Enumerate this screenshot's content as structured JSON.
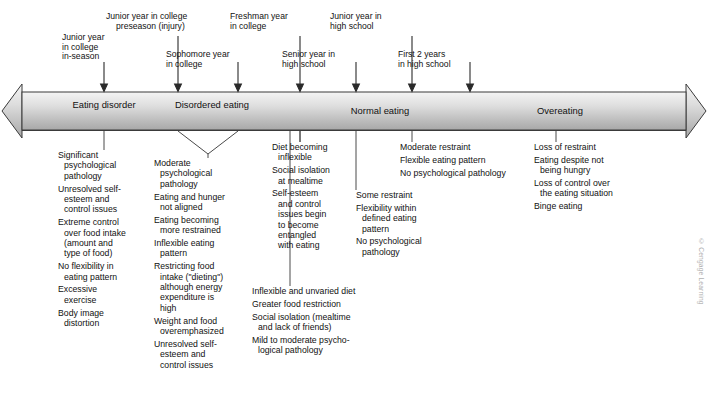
{
  "figure": {
    "credit": "© Cengage Learning",
    "caption": ""
  },
  "band": {
    "stages": [
      {
        "label_line1": "Eating",
        "label_line2": "disorder"
      },
      {
        "label_line1": "Disordered",
        "label_line2": "eating"
      },
      {
        "label_line1": "Normal eating",
        "label_line2": ""
      },
      {
        "label_line1": "Overeating",
        "label_line2": ""
      }
    ]
  },
  "callouts": [
    {
      "lines": [
        "Junior year",
        "in college",
        "in-season"
      ]
    },
    {
      "lines": [
        "Junior year in college",
        "preseason (injury)"
      ]
    },
    {
      "lines": [
        "Sophomore year",
        "in college"
      ]
    },
    {
      "lines": [
        "Freshman year",
        "in college"
      ]
    },
    {
      "lines": [
        "Senior year in",
        "high school"
      ]
    },
    {
      "lines": [
        "Junior year in",
        "high school"
      ]
    },
    {
      "lines": [
        "First 2 years",
        "in high school"
      ]
    }
  ],
  "columns": [
    {
      "name": "eating-disorder-traits",
      "items": [
        {
          "lines": [
            "Significant",
            "psychological",
            "pathology"
          ]
        },
        {
          "lines": [
            "Unresolved self-",
            "esteem and",
            "control issues"
          ]
        },
        {
          "lines": [
            "Extreme control",
            "over food intake",
            "(amount and",
            "type of food)"
          ]
        },
        {
          "lines": [
            "No flexibility in",
            "eating pattern"
          ]
        },
        {
          "lines": [
            "Excessive",
            "exercise"
          ]
        },
        {
          "lines": [
            "Body image",
            "distortion"
          ]
        }
      ]
    },
    {
      "name": "disordered-eating-traits",
      "items": [
        {
          "lines": [
            "Moderate",
            "psychological",
            "pathology"
          ]
        },
        {
          "lines": [
            "Eating and hunger",
            "not aligned"
          ]
        },
        {
          "lines": [
            "Eating becoming",
            "more restrained"
          ]
        },
        {
          "lines": [
            "Inflexible eating",
            "pattern"
          ]
        },
        {
          "lines": [
            "Restricting food",
            "intake (\"dieting\")",
            "although energy",
            "expenditure is",
            "high"
          ]
        },
        {
          "lines": [
            "Weight and food",
            "overemphasized"
          ]
        },
        {
          "lines": [
            "Unresolved self-",
            "esteem and",
            "control issues"
          ]
        }
      ]
    },
    {
      "name": "diet-becoming-inflexible-traits",
      "items": [
        {
          "lines": [
            "Diet becoming",
            "inflexible"
          ]
        },
        {
          "lines": [
            "Social isolation",
            "at mealtime"
          ]
        },
        {
          "lines": [
            "Self-esteem",
            "and control",
            "issues begin",
            "to become",
            "entangled",
            "with eating"
          ]
        }
      ]
    },
    {
      "name": "inflexible-unvaried-diet-traits",
      "items": [
        {
          "lines": [
            "Inflexible and unvaried diet"
          ]
        },
        {
          "lines": [
            "Greater food restriction"
          ]
        },
        {
          "lines": [
            "Social isolation (mealtime",
            "and lack of friends)"
          ]
        },
        {
          "lines": [
            "Mild to moderate psycho-",
            "logical pathology"
          ]
        }
      ]
    },
    {
      "name": "some-restraint-traits",
      "items": [
        {
          "lines": [
            "Some restraint"
          ]
        },
        {
          "lines": [
            "Flexibility within",
            "defined eating",
            "pattern"
          ]
        },
        {
          "lines": [
            "No psychological",
            "pathology"
          ]
        }
      ]
    },
    {
      "name": "moderate-restraint-traits",
      "items": [
        {
          "lines": [
            "Moderate restraint"
          ]
        },
        {
          "lines": [
            "Flexible eating pattern"
          ]
        },
        {
          "lines": [
            "No psychological pathology"
          ]
        }
      ]
    },
    {
      "name": "overeating-traits",
      "items": [
        {
          "lines": [
            "Loss of restraint"
          ]
        },
        {
          "lines": [
            "Eating despite not",
            "being hungry"
          ]
        },
        {
          "lines": [
            "Loss of control over",
            "the eating situation"
          ]
        },
        {
          "lines": [
            "Binge eating"
          ]
        }
      ]
    }
  ]
}
